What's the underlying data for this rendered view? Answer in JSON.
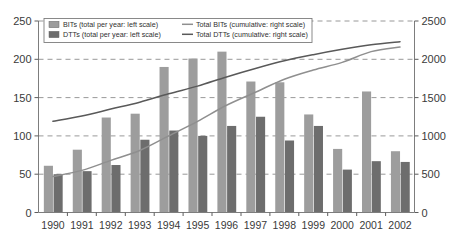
{
  "chart_data": {
    "type": "bar",
    "title": "",
    "subtitle": "",
    "xlabel": "",
    "ylabel": "",
    "y2label": "",
    "categories": [
      "1990",
      "1991",
      "1992",
      "1993",
      "1994",
      "1995",
      "1996",
      "1997",
      "1998",
      "1999",
      "2000",
      "2001",
      "2002"
    ],
    "ylim": [
      0,
      250
    ],
    "y2lim": [
      0,
      2500
    ],
    "yticks": [
      "0",
      "50",
      "100",
      "150",
      "200",
      "250"
    ],
    "y2ticks": [
      "0",
      "500",
      "1000",
      "1500",
      "2000",
      "2500"
    ],
    "grid": true,
    "legend_position": "top-left inside",
    "series": [
      {
        "name": "BITs (total per year: left scale)",
        "type": "bar",
        "axis": "left",
        "color": "#9d9d9d",
        "values": [
          61,
          82,
          124,
          129,
          190,
          201,
          210,
          171,
          170,
          128,
          83,
          158,
          80
        ]
      },
      {
        "name": "DTTs (total per year: left scale)",
        "type": "bar",
        "axis": "left",
        "color": "#6d6d6d",
        "values": [
          50,
          54,
          62,
          95,
          107,
          100,
          113,
          125,
          94,
          113,
          56,
          67,
          66
        ]
      },
      {
        "name": "Total BITs (cumulative: right scale)",
        "type": "line",
        "axis": "right",
        "color": "#8f8f8f",
        "values": [
          470,
          550,
          680,
          810,
          1000,
          1190,
          1400,
          1570,
          1740,
          1860,
          1960,
          2100,
          2160
        ]
      },
      {
        "name": "Total DTTs (cumulative: right scale)",
        "type": "line",
        "axis": "right",
        "color": "#595959",
        "values": [
          1190,
          1260,
          1350,
          1440,
          1550,
          1650,
          1770,
          1880,
          1980,
          2060,
          2130,
          2190,
          2230
        ]
      }
    ],
    "legend": [
      {
        "label": "BITs (total per year: left scale)",
        "marker": "swatch",
        "color": "#9d9d9d"
      },
      {
        "label": "DTTs (total per year: left scale)",
        "marker": "swatch",
        "color": "#6d6d6d"
      },
      {
        "label": "Total BITs (cumulative: right scale)",
        "marker": "line",
        "color": "#8f8f8f"
      },
      {
        "label": "Total DTTs (cumulative: right scale)",
        "marker": "line",
        "color": "#595959"
      }
    ]
  },
  "colors": {
    "bar_bits": "#9d9d9d",
    "bar_dtts": "#6d6d6d",
    "line_bits": "#8f8f8f",
    "line_dtts": "#595959",
    "grid": "#8d8d8d",
    "frame": "#7d7d7d",
    "background": "#ffffff"
  }
}
